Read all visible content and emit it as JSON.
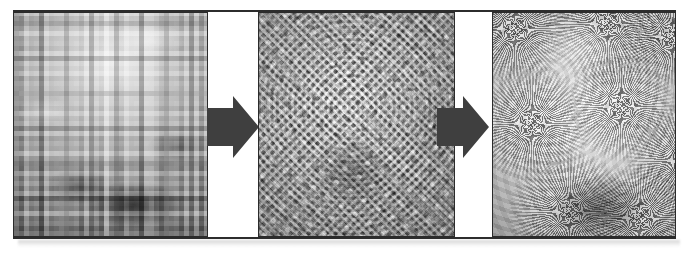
{
  "figure": {
    "orientation": "horizontal",
    "background_color": "#ffffff",
    "frame_rule_color": "#2c2c2c",
    "panel_border_color": "#2b2b2b",
    "arrow_color": "#3f3f3f"
  },
  "panels": [
    {
      "id": "blocky",
      "label": "Blocky pixelated grayscale image",
      "texture": "coarse square mosaic blocks, smooth bright region upper-centre, dark clustered blocks lower-centre",
      "tone_range": "light gray to near black"
    },
    {
      "id": "halftone",
      "label": "Halftone dot moire pattern",
      "texture": "dense regular grid of circular dots forming concentric diamond moire interference",
      "tone_range": "white to dark gray"
    },
    {
      "id": "starburst",
      "label": "Radial starburst flower pattern",
      "texture": "overlapping radial petal bursts radiating from multiple centres",
      "tone_range": "white to dark gray"
    }
  ],
  "arrows": [
    {
      "id": "arrow-1",
      "label": "transforms into",
      "direction": "right"
    },
    {
      "id": "arrow-2",
      "label": "transforms into",
      "direction": "right"
    }
  ]
}
